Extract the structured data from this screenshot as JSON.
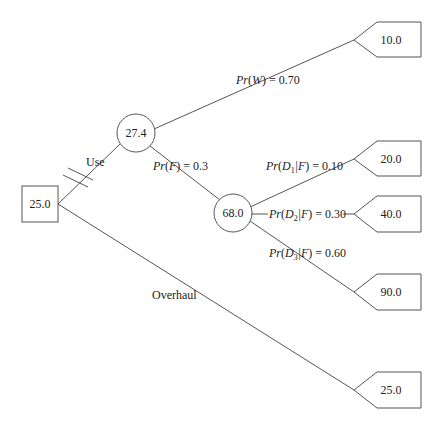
{
  "diagram": {
    "type": "decision-tree",
    "decision_node": {
      "value": "25.0"
    },
    "branches": {
      "use": {
        "label": "Use"
      },
      "overhaul": {
        "label": "Overhaul"
      }
    },
    "chance_nodes": {
      "use_node": {
        "value": "27.4"
      },
      "failure_node": {
        "value": "68.0"
      }
    },
    "probabilities": {
      "w": {
        "func": "Pr",
        "arg": "W",
        "value": "= 0.70"
      },
      "f": {
        "func": "Pr",
        "arg": "F",
        "value": "= 0.3"
      },
      "d1": {
        "func": "Pr",
        "arg": "D",
        "sub": "1",
        "cond": "|F",
        "value": "= 0.10"
      },
      "d2": {
        "func": "Pr",
        "arg": "D",
        "sub": "2",
        "cond": "|F",
        "value": "= 0.30"
      },
      "d3": {
        "func": "Pr",
        "arg": "D",
        "sub": "3",
        "cond": "|F",
        "value": "= 0.60"
      }
    },
    "terminals": [
      {
        "id": "w",
        "value": "10.0"
      },
      {
        "id": "d1",
        "value": "20.0"
      },
      {
        "id": "d2",
        "value": "40.0"
      },
      {
        "id": "d3",
        "value": "90.0"
      },
      {
        "id": "overhaul",
        "value": "25.0"
      }
    ]
  }
}
